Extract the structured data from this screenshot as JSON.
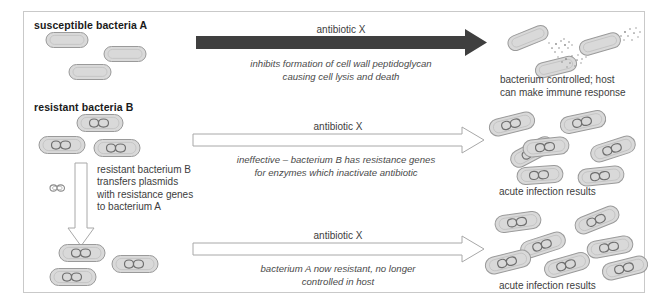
{
  "figure": {
    "colors": {
      "frame_border": "#c9c9c9",
      "background": "#ffffff",
      "solid_arrow": "#3f3f3f",
      "hollow_arrow_stroke": "#a8a8a8",
      "cell_fill": "#d9d9d9",
      "cell_stroke": "#9a9a9a",
      "plasmid_stroke": "#6f6f6f",
      "text_dark": "#1a1a1a",
      "text_body": "#3d3d3d",
      "debris": "#8a8a8a"
    }
  },
  "rows": [
    {
      "id": "row-susceptible",
      "title": "susceptible bacteria A",
      "arrow": {
        "style": "solid",
        "label": "antibiotic X",
        "caption_lines": [
          "inhibits formation of cell wall peptidoglycan",
          "causing cell lysis and death"
        ]
      },
      "result": {
        "caption_lines": [
          "bacterium controlled; host",
          "can make immune response"
        ],
        "cell_count": 3,
        "cell_type": "lysing-susceptible"
      },
      "source_cell_count": 3,
      "source_cell_type": "susceptible"
    },
    {
      "id": "row-resistant",
      "title": "resistant bacteria B",
      "arrow": {
        "style": "hollow",
        "label": "antibiotic X",
        "caption_lines": [
          "ineffective – bacterium B has resistance genes",
          "for enzymes which inactivate antibiotic"
        ]
      },
      "result": {
        "caption_lines": [
          "acute infection results"
        ],
        "cell_count": 7,
        "cell_type": "resistant"
      },
      "source_cell_count": 3,
      "source_cell_type": "resistant"
    },
    {
      "id": "row-transferred",
      "title": "",
      "arrow": {
        "style": "hollow",
        "label": "antibiotic X",
        "caption_lines": [
          "bacterium A now resistant, no longer",
          "controlled in host"
        ]
      },
      "result": {
        "caption_lines": [
          "acute infection results"
        ],
        "cell_count": 7,
        "cell_type": "resistant"
      },
      "source_cell_count": 3,
      "source_cell_type": "resistant"
    }
  ],
  "transfer": {
    "arrow_direction": "down",
    "note_lines": [
      "resistant bacterium B",
      "transfers plasmids",
      "with resistance genes",
      "to bacterium A"
    ],
    "free_plasmid_label": "free plasmid"
  }
}
